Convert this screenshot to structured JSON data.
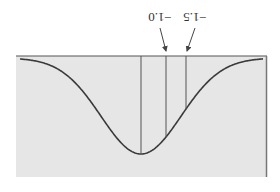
{
  "figure": {
    "orientation": "rotated-180",
    "background_color": "#ffffff",
    "panel_fill": "#e6e6e6",
    "curve_color": "#3a3a3a",
    "line_color": "#555555"
  },
  "annotations": [
    {
      "label": "−1.0",
      "z": -1.0
    },
    {
      "label": "−1.5",
      "z": -1.5
    }
  ],
  "chart_data": {
    "type": "line",
    "title": "",
    "xlabel": "",
    "ylabel": "",
    "x": [
      -3,
      -2.5,
      -2,
      -1.5,
      -1,
      -0.5,
      0,
      0.5,
      1,
      1.5,
      2,
      2.5,
      3
    ],
    "series": [
      {
        "name": "normal density",
        "values": [
          0.004,
          0.018,
          0.054,
          0.13,
          0.242,
          0.352,
          0.399,
          0.352,
          0.242,
          0.13,
          0.054,
          0.018,
          0.004
        ]
      }
    ],
    "reference_lines": [
      {
        "z": 0,
        "label": ""
      },
      {
        "z": -1.0,
        "label": "−1.0"
      },
      {
        "z": -1.5,
        "label": "−1.5"
      }
    ],
    "xlim": [
      -3.5,
      3.5
    ],
    "grid": false,
    "legend": "none"
  }
}
